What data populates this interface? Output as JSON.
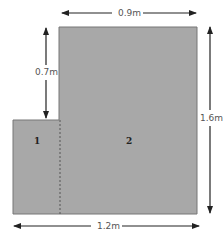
{
  "diagram": {
    "type": "composite-rectangle-area",
    "shape_color": "#a8a8a8",
    "outline_color": "#777777",
    "regions": [
      {
        "id": "1",
        "label": "1"
      },
      {
        "id": "2",
        "label": "2"
      }
    ],
    "dimensions": {
      "top_width": "0.9m",
      "left_step_height": "0.7m",
      "right_height": "1.6m",
      "bottom_width": "1.2m"
    }
  }
}
